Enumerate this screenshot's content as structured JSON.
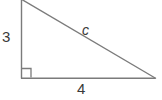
{
  "figure": {
    "type": "right-triangle-diagram",
    "background_color": "#ffffff",
    "stroke_color": "#7b7b7b",
    "text_color": "#3a3a3a",
    "stroke_width": 1.4,
    "vertices": {
      "apex": {
        "x": 21,
        "y": 0
      },
      "right_angle": {
        "x": 21,
        "y": 78
      },
      "base_right": {
        "x": 155,
        "y": 78
      }
    },
    "right_angle_marker": {
      "name": "right-angle-square",
      "x": 22,
      "y": 68,
      "size": 9
    },
    "labels": {
      "vertical_leg": "3",
      "horizontal_leg": "4",
      "hypotenuse": "c"
    }
  }
}
